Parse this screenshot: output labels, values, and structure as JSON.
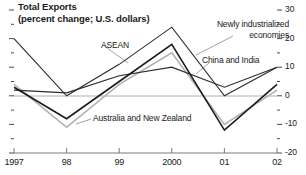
{
  "figure": {
    "title_lines": [
      "Total Exports",
      "(percent change; U.S. dollars)"
    ]
  },
  "chart_data": {
    "type": "line",
    "title": "Total Exports",
    "subtitle": "(percent change; U.S. dollars)",
    "xlabel": "",
    "ylabel": "percent change; U.S. dollars",
    "x": [
      1997,
      1998,
      1999,
      2000,
      2001,
      2002
    ],
    "xtick_labels": [
      "1997",
      "98",
      "99",
      "2000",
      "01",
      "02"
    ],
    "ytick_labels": [
      "30",
      "20",
      "10",
      "0",
      "-10",
      "-20"
    ],
    "ytick_values": [
      30,
      20,
      10,
      0,
      -10,
      -20
    ],
    "ylim": [
      -20,
      30
    ],
    "yminor_step": 5,
    "grid": false,
    "zero_line": true,
    "legend_position": "inline-annotations",
    "series": [
      {
        "name": "ASEAN",
        "color": "#2b2b2b",
        "width": 1.1,
        "values": [
          20,
          0,
          11,
          24,
          0,
          10
        ],
        "label": "ASEAN",
        "label_x": 101,
        "label_y": 40,
        "leader": [
          [
            103,
            45
          ],
          [
            128,
            63
          ]
        ]
      },
      {
        "name": "Newly industrialized economies",
        "color": "#1a1a1a",
        "width": 1.6,
        "values": [
          3,
          -8,
          5,
          18,
          -12,
          4
        ],
        "label": "Newly industrialized economies",
        "label_x": 203,
        "label_y": 19,
        "leader": [
          [
            233,
            36
          ],
          [
            196,
            55
          ]
        ]
      },
      {
        "name": "China and India",
        "color": "#2b2b2b",
        "width": 1.2,
        "values": [
          2,
          1,
          7,
          10,
          3,
          10
        ],
        "label": "China and India",
        "label_x": 202,
        "label_y": 55,
        "leader": [
          [
            209,
            63
          ],
          [
            196,
            74
          ]
        ]
      },
      {
        "name": "Australia and New Zealand",
        "color": "#b0b0b0",
        "width": 1.6,
        "values": [
          4,
          -11,
          4,
          15,
          -10,
          2
        ],
        "label": "Australia and New Zealand",
        "label_x": 93,
        "label_y": 113,
        "leader": [
          [
            91,
            119
          ],
          [
            76,
            124
          ]
        ]
      }
    ]
  }
}
